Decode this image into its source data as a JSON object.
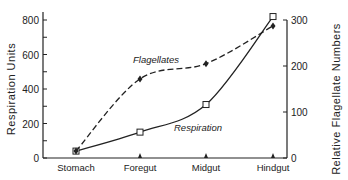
{
  "chart_data": {
    "type": "line",
    "title": "",
    "categories": [
      "Stomach",
      "Foregut",
      "Midgut",
      "Hindgut"
    ],
    "xlabel": "",
    "ylabel": "Respiration Units",
    "y2label": "Relative Flagellate Numbers",
    "ylim": [
      0,
      800
    ],
    "y2lim": [
      0,
      300
    ],
    "yticks": [
      0,
      200,
      400,
      600,
      800
    ],
    "y2ticks": [
      0,
      100,
      200,
      300
    ],
    "grid": false,
    "series": [
      {
        "name": "Respiration",
        "axis": "left",
        "style": "solid",
        "marker": "open-square",
        "values": [
          40,
          150,
          310,
          820
        ]
      },
      {
        "name": "Flagellates",
        "axis": "right",
        "style": "dashed",
        "marker": "filled-diamond",
        "values": [
          15,
          172,
          205,
          287
        ]
      }
    ],
    "annotations": [
      {
        "text": "Flagellates",
        "near": "dashed curve above Foregut-Midgut"
      },
      {
        "text": "Respiration",
        "near": "solid curve below Midgut"
      }
    ]
  }
}
